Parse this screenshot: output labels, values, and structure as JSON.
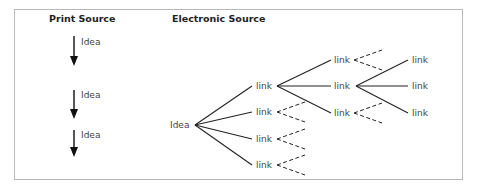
{
  "print_source": {
    "title": "Print Source",
    "ideas": [
      "Idea",
      "Idea",
      "Idea"
    ]
  },
  "electronic_source": {
    "title": "Electronic Source",
    "root": "Idea",
    "level1": [
      "link",
      "link",
      "link",
      "link"
    ],
    "level2": [
      "link",
      "link",
      "link"
    ],
    "level3": [
      "link",
      "link",
      "link"
    ]
  }
}
